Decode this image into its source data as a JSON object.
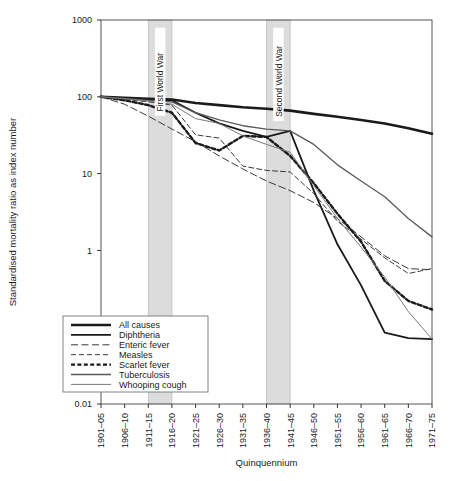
{
  "chart_data": {
    "type": "line",
    "title": "",
    "xlabel": "Quinquennium",
    "ylabel": "Standardised mortality ratio as index number",
    "log_y": true,
    "ylim": [
      0.01,
      1000
    ],
    "ytick_labels": [
      "1000",
      "100",
      "10",
      "1",
      "0.1",
      "0.01"
    ],
    "ytick_values": [
      1000,
      100,
      10,
      1,
      0.1,
      0.01
    ],
    "grid": false,
    "legend_position": "bottom-left",
    "categories": [
      "1901–05",
      "1906–10",
      "1911–15",
      "1916–20",
      "1921–25",
      "1926–30",
      "1931–35",
      "1936–40",
      "1941–45",
      "1946–50",
      "1951–55",
      "1956–60",
      "1961–65",
      "1966–70",
      "1971–75"
    ],
    "series": [
      {
        "name": "All causes",
        "style": "thick-solid",
        "color": "#1a1a1a",
        "width": 2.6,
        "dash": "",
        "values": [
          100,
          97,
          94,
          92,
          83,
          78,
          73,
          70,
          66,
          60,
          55,
          50,
          45,
          39,
          33
        ]
      },
      {
        "name": "Diphtheria",
        "style": "medium-solid",
        "color": "#1a1a1a",
        "width": 1.8,
        "dash": "",
        "values": [
          100,
          96,
          93,
          90,
          62,
          45,
          36,
          30,
          36,
          6.0,
          1.2,
          0.35,
          0.085,
          0.072,
          0.07
        ]
      },
      {
        "name": "Enteric fever",
        "style": "long-dash",
        "color": "#3a3a3a",
        "width": 1.0,
        "dash": "7,3.5",
        "values": [
          100,
          80,
          56,
          38,
          26,
          17,
          11.5,
          8.0,
          6.0,
          4.2,
          2.6,
          1.5,
          0.85,
          0.58,
          0.56
        ]
      },
      {
        "name": "Measles",
        "style": "dash",
        "color": "#3a3a3a",
        "width": 1.0,
        "dash": "5,3",
        "values": [
          100,
          92,
          86,
          78,
          32,
          29,
          12.5,
          11.0,
          10.5,
          5.5,
          2.4,
          1.4,
          0.8,
          0.5,
          0.58
        ]
      },
      {
        "name": "Scarlet fever",
        "style": "thick-dotted",
        "color": "#1a1a1a",
        "width": 2.4,
        "dash": "4,2.4",
        "values": [
          100,
          90,
          78,
          62,
          25,
          20,
          31,
          30,
          17,
          7.5,
          3.0,
          1.3,
          0.4,
          0.22,
          0.17
        ]
      },
      {
        "name": "Tuberculosis",
        "style": "medium-solid",
        "color": "#5a5a5a",
        "width": 1.3,
        "dash": "",
        "values": [
          100,
          95,
          90,
          86,
          62,
          50,
          42,
          38,
          36,
          24,
          13,
          8.0,
          5.0,
          2.6,
          1.5
        ]
      },
      {
        "name": "Whooping cough",
        "style": "thin-solid",
        "color": "#7a7a7a",
        "width": 1.0,
        "dash": "",
        "values": [
          100,
          94,
          88,
          80,
          52,
          45,
          31,
          24,
          19,
          7.0,
          2.6,
          1.1,
          0.45,
          0.16,
          0.07
        ]
      }
    ],
    "bands": [
      {
        "label": "First World War",
        "start_index": 2,
        "end_index": 3,
        "color": "#dcdcdc"
      },
      {
        "label": "Second World War",
        "start_index": 7,
        "end_index": 8,
        "color": "#dcdcdc"
      }
    ]
  }
}
